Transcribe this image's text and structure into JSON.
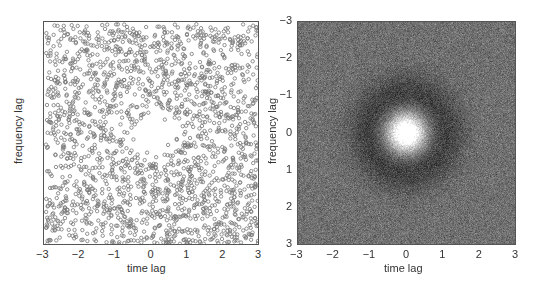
{
  "chart_data": [
    {
      "type": "scatter",
      "title": "",
      "xlabel": "time lag",
      "ylabel": "frequency lag",
      "xlim": [
        -3,
        3
      ],
      "ylim": [
        -3,
        3
      ],
      "y_direction": "up",
      "xticks": [
        "−3",
        "−2",
        "−1",
        "0",
        "1",
        "2",
        "3"
      ],
      "yticks": [
        "3",
        "2",
        "1",
        "0",
        "−1",
        "−2",
        "−3"
      ],
      "grid": false,
      "legend": null,
      "marker": "open circle",
      "marker_color": "#777777",
      "description": "Approximately 2000 uniformly scattered points over [-3,3]x[-3,3] with a sparse (empty) region of radius ~0.5 around the origin",
      "approx_point_count": 2000,
      "exclusion_radius": 0.5
    },
    {
      "type": "heatmap",
      "title": "",
      "xlabel": "time lag",
      "ylabel": "frequency lag",
      "xlim": [
        -3,
        3
      ],
      "ylim": [
        -3,
        3
      ],
      "y_direction": "down",
      "xticks": [
        "−3",
        "−2",
        "−1",
        "0",
        "1",
        "2",
        "3"
      ],
      "yticks": [
        "−3",
        "−2",
        "−1",
        "0",
        "1",
        "2",
        "3"
      ],
      "grid": false,
      "legend": null,
      "colormap": "gray",
      "description": "Noisy grayscale image with a bright Gaussian peak at (0,0), radius ~0.7, surrounded by a darker ring out to ~1.5, mid-gray background",
      "peak_center": [
        0,
        0
      ],
      "peak_radius": 0.7,
      "dark_ring_radius": 1.5,
      "colors": {
        "background": "#707070",
        "ring": "#3c3c3c",
        "peak": "#ffffff"
      }
    }
  ]
}
